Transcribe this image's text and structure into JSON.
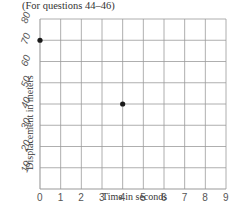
{
  "header": {
    "title": "(For questions 44–46)"
  },
  "chart_data": {
    "type": "scatter",
    "title": "(For questions 44–46)",
    "xlabel": "Time in seconds",
    "ylabel": "Displacement in meters",
    "x_ticks": [
      "0",
      "1",
      "2",
      "3",
      "4",
      "5",
      "6",
      "7",
      "8",
      "9"
    ],
    "y_ticks": [
      "10",
      "20",
      "30",
      "40",
      "50",
      "60",
      "70",
      "80"
    ],
    "xlim": [
      0,
      9
    ],
    "ylim": [
      0,
      80
    ],
    "grid": true,
    "points": [
      {
        "x": 0,
        "y": 70
      },
      {
        "x": 4,
        "y": 40
      }
    ]
  },
  "style": {
    "grid_color": "#9a9a9a",
    "point_color": "#1a1a1a"
  }
}
